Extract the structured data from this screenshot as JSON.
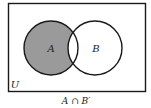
{
  "diagram": {
    "type": "venn",
    "universe_label": "U",
    "sets": [
      {
        "label": "A",
        "shaded_region": "A only"
      },
      {
        "label": "B"
      }
    ],
    "caption": "A ∩ B′",
    "colors": {
      "background": "#ffffff",
      "outline": "#1a1a1a",
      "shade": "#9a9a9a",
      "text": "#222222"
    }
  }
}
